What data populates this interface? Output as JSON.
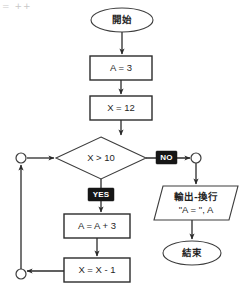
{
  "header": {
    "partial_text": "= ++"
  },
  "diagram": {
    "nodes": [
      {
        "id": "start",
        "type": "terminator",
        "label": "開始",
        "lang": "cjk",
        "x": 91,
        "y": 20,
        "w": 62,
        "h": 24
      },
      {
        "id": "assign-a",
        "type": "process",
        "label": "A = 3",
        "lang": "latin",
        "x": 90,
        "y": 56,
        "w": 62,
        "h": 24
      },
      {
        "id": "assign-x",
        "type": "process",
        "label": "X = 12",
        "lang": "latin",
        "x": 90,
        "y": 96,
        "w": 62,
        "h": 24
      },
      {
        "id": "decision-x-gt-10",
        "type": "decision",
        "label": "X > 10",
        "lang": "latin",
        "x": 56,
        "y": 137,
        "w": 90,
        "h": 42
      },
      {
        "id": "increment-a",
        "type": "process",
        "label": "A = A + 3",
        "lang": "latin",
        "x": 64,
        "y": 214,
        "w": 64,
        "h": 24
      },
      {
        "id": "decrement-x",
        "type": "process",
        "label": "X = X - 1",
        "lang": "latin",
        "x": 64,
        "y": 258,
        "w": 64,
        "h": 24
      },
      {
        "id": "output",
        "type": "io-parallelogram",
        "label_line1": "輸出-換行",
        "label_line2": "\"A = \", A",
        "x": 154,
        "y": 186,
        "w": 76,
        "h": 34
      },
      {
        "id": "end",
        "type": "terminator",
        "label": "結束",
        "lang": "cjk",
        "x": 163,
        "y": 241,
        "w": 58,
        "h": 24
      }
    ],
    "connectors": [
      {
        "id": "connector-loop-top",
        "cx": 21,
        "cy": 158,
        "r": 5
      },
      {
        "id": "connector-loop-bottom",
        "cx": 21,
        "cy": 274,
        "r": 5
      },
      {
        "id": "connector-no-branch",
        "cx": 196,
        "cy": 158,
        "r": 5
      }
    ],
    "branch_labels": [
      {
        "id": "branch-no",
        "text": "NO",
        "x": 167,
        "y": 158
      },
      {
        "id": "branch-yes",
        "text": "YES",
        "x": 101,
        "y": 195
      }
    ],
    "colors": {
      "stroke": "#2b2b2b",
      "shape_fill": "#ffffff",
      "badge_bg": "#161616",
      "badge_text": "#ffffff",
      "page_bg": "#ffffff"
    }
  }
}
